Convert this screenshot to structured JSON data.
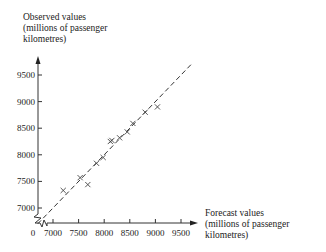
{
  "chart_data": {
    "type": "scatter",
    "title": "",
    "xlabel": "Forecast values (millions of passenger kilometres)",
    "ylabel": "Observed values (millions of passenger kilometres)",
    "xlabel_lines": [
      "Forecast values",
      "(millions of passenger",
      "kilometres)"
    ],
    "ylabel_lines": [
      "Observed values",
      "(millions of passenger",
      "kilometres)"
    ],
    "x_ticks": [
      7000,
      7500,
      8000,
      8500,
      9000,
      9500
    ],
    "y_ticks": [
      7000,
      7500,
      8000,
      8500,
      9000,
      9500
    ],
    "origin_label": "0",
    "axis_break": true,
    "xlim": [
      6800,
      9800
    ],
    "ylim": [
      6800,
      9800
    ],
    "grid": false,
    "marker": "x",
    "reference_line": {
      "style": "dashed",
      "equation": "y = x"
    },
    "points": [
      {
        "x": 7200,
        "y": 7330
      },
      {
        "x": 7530,
        "y": 7570
      },
      {
        "x": 7680,
        "y": 7440
      },
      {
        "x": 7850,
        "y": 7840
      },
      {
        "x": 7980,
        "y": 7950
      },
      {
        "x": 8120,
        "y": 8250
      },
      {
        "x": 8150,
        "y": 8270
      },
      {
        "x": 8300,
        "y": 8320
      },
      {
        "x": 8450,
        "y": 8430
      },
      {
        "x": 8560,
        "y": 8590
      },
      {
        "x": 8800,
        "y": 8800
      },
      {
        "x": 9040,
        "y": 8900
      }
    ]
  }
}
